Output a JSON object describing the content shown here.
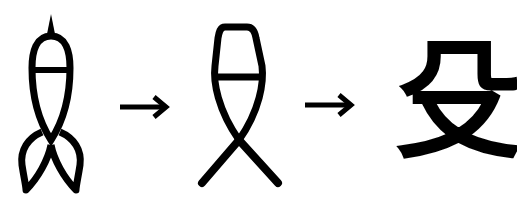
{
  "diagram": {
    "type": "character-evolution",
    "stages": [
      {
        "id": "stage-1",
        "form": "oracle-bone",
        "description": "ancient pictograph with pointed tip and two looped legs"
      },
      {
        "id": "stage-2",
        "form": "seal-script",
        "description": "oval head with crossbar and crossed legs"
      },
      {
        "id": "stage-3",
        "form": "modern",
        "character": "殳"
      }
    ],
    "connectors": [
      {
        "from": "stage-1",
        "to": "stage-2",
        "symbol": "→"
      },
      {
        "from": "stage-2",
        "to": "stage-3",
        "symbol": "→"
      }
    ],
    "colors": {
      "ink": "#000000",
      "background": "#ffffff"
    }
  }
}
